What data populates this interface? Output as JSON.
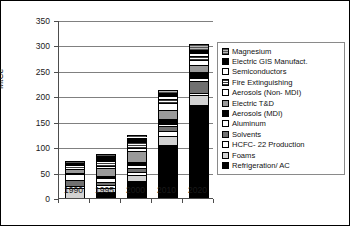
{
  "figure": {
    "background": "#ffffff",
    "border_color": "#000000"
  },
  "axis": {
    "ylabel": "MtCe",
    "yticks": [
      "0",
      "50",
      "100",
      "150",
      "200",
      "250",
      "300",
      "350"
    ],
    "xticks": [
      "1990",
      "1995",
      "2000",
      "2010",
      "2020"
    ]
  },
  "legend": {
    "items": [
      {
        "label": "Magnesium",
        "pattern": "p-crosshatch"
      },
      {
        "label": "Electric GIS Manufact.",
        "pattern": "p-solid-black"
      },
      {
        "label": "Semiconductors",
        "pattern": "p-white"
      },
      {
        "label": "Fire Extinguishing",
        "pattern": "p-hatch-med"
      },
      {
        "label": "Aerosols (Non- MDI)",
        "pattern": "p-white"
      },
      {
        "label": "Electric T&D",
        "pattern": "p-gray-med"
      },
      {
        "label": "Aerosols (MDI)",
        "pattern": "p-solid-black"
      },
      {
        "label": "Aluminum",
        "pattern": "p-dot"
      },
      {
        "label": "Solvents",
        "pattern": "p-gray-dark"
      },
      {
        "label": "HCFC- 22 Production",
        "pattern": "p-white"
      },
      {
        "label": "Foams",
        "pattern": "p-gray-light"
      },
      {
        "label": "Refrigeration/ AC",
        "pattern": "p-solid-black"
      }
    ]
  },
  "chart_data": {
    "type": "bar",
    "subtype": "stacked",
    "title": "",
    "xlabel": "",
    "ylabel": "MtCe",
    "ylim": [
      0,
      350
    ],
    "ytick_step": 50,
    "grid": true,
    "legend_position": "right",
    "categories": [
      "1990",
      "1995",
      "2000",
      "2010",
      "2020"
    ],
    "series": [
      {
        "name": "Refrigeration/ AC",
        "pattern": "p-solid-black",
        "values": [
          0,
          11,
          33,
          105,
          183
        ]
      },
      {
        "name": "Foams",
        "pattern": "p-gray-light",
        "values": [
          20,
          9,
          13,
          16,
          20
        ]
      },
      {
        "name": "HCFC- 22 Production",
        "pattern": "p-white",
        "values": [
          3,
          5,
          5,
          11,
          4
        ]
      },
      {
        "name": "Solvents",
        "pattern": "p-gray-dark",
        "values": [
          13,
          7,
          8,
          9,
          24
        ]
      },
      {
        "name": "Aluminum",
        "pattern": "p-dot",
        "values": [
          11,
          7,
          6,
          5,
          5
        ]
      },
      {
        "name": "Aerosols (MDI)",
        "pattern": "p-solid-black",
        "values": [
          2,
          4,
          5,
          9,
          11
        ]
      },
      {
        "name": "Electric T&D",
        "pattern": "p-gray-med",
        "values": [
          9,
          16,
          22,
          18,
          15
        ]
      },
      {
        "name": "Aerosols (Non- MDI)",
        "pattern": "p-white",
        "values": [
          2,
          4,
          6,
          13,
          9
        ]
      },
      {
        "name": "Fire Extinguishing",
        "pattern": "p-hatch-med",
        "values": [
          5,
          10,
          12,
          9,
          8
        ]
      },
      {
        "name": "Semiconductors",
        "pattern": "p-white",
        "values": [
          1,
          2,
          3,
          5,
          6
        ]
      },
      {
        "name": "Electric GIS Manufact.",
        "pattern": "p-solid-black",
        "values": [
          3,
          7,
          6,
          6,
          7
        ]
      },
      {
        "name": "Magnesium",
        "pattern": "p-crosshatch",
        "values": [
          3,
          4,
          4,
          6,
          10
        ]
      }
    ],
    "totals": [
      72,
      86,
      123,
      212,
      302
    ]
  }
}
